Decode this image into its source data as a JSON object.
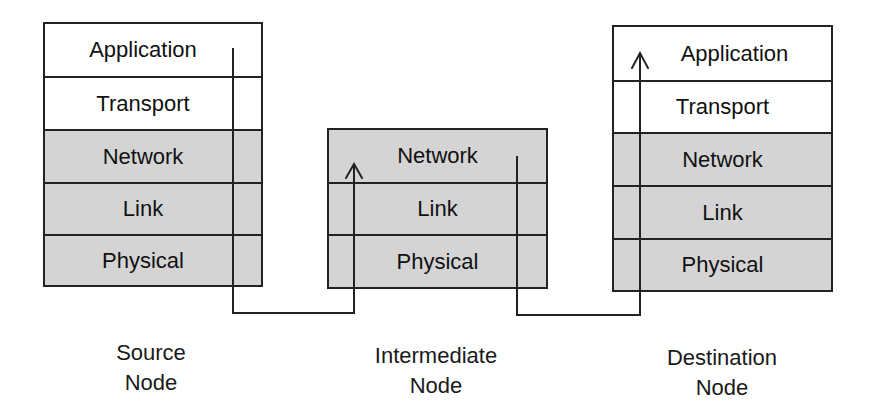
{
  "diagram": {
    "type": "network-protocol-stack-path",
    "nodes": [
      {
        "id": "source",
        "caption_line1": "Source",
        "caption_line2": "Node",
        "layers": [
          "Application",
          "Transport",
          "Network",
          "Link",
          "Physical"
        ]
      },
      {
        "id": "intermediate",
        "caption_line1": "Intermediate",
        "caption_line2": "Node",
        "layers": [
          "Network",
          "Link",
          "Physical"
        ]
      },
      {
        "id": "destination",
        "caption_line1": "Destination",
        "caption_line2": "Node",
        "layers": [
          "Application",
          "Transport",
          "Network",
          "Link",
          "Physical"
        ]
      }
    ],
    "edges": [
      {
        "from": "source.Application",
        "to": "intermediate.Network",
        "via": "Physical links below stacks",
        "arrow": "up"
      },
      {
        "from": "intermediate.Network",
        "to": "destination.Application",
        "via": "Physical links below stacks",
        "arrow": "up"
      }
    ],
    "colors": {
      "upper_layer_fill": "#ffffff",
      "lower_layer_fill": "#d4d4d4",
      "stroke": "#222222"
    }
  }
}
